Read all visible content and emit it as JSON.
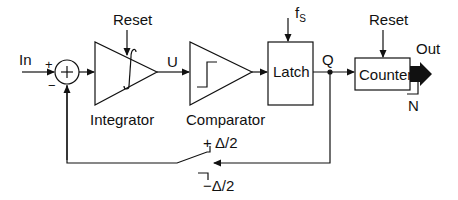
{
  "diagram": {
    "type": "block-diagram",
    "input_label": "In",
    "sum_plus": "+",
    "sum_minus": "−",
    "blocks": [
      {
        "id": "integrator",
        "label": "Integrator",
        "symbol": "∫",
        "reset": "Reset"
      },
      {
        "id": "comparator",
        "label": "Comparator"
      },
      {
        "id": "latch",
        "label": "Latch",
        "clock": "f",
        "clock_sub": "S"
      },
      {
        "id": "counter",
        "label": "Counter",
        "reset": "Reset"
      }
    ],
    "signals": {
      "u": "U",
      "q": "Q",
      "out": "Out",
      "n": "N"
    },
    "feedback": {
      "plus": "+ Δ/2",
      "minus": "−Δ/2"
    },
    "colors": {
      "stroke": "#111111",
      "background": "#ffffff"
    }
  }
}
